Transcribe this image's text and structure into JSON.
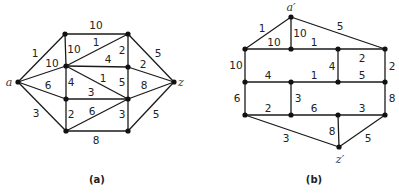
{
  "figure": {
    "graphs": [
      {
        "id": "a",
        "caption": "(a)",
        "caption_pos": [
          97,
          179
        ],
        "vertices": {
          "a": {
            "x": 18,
            "y": 82,
            "label": "a",
            "label_pos": [
              9,
              82
            ]
          },
          "L1": {
            "x": 65,
            "y": 34
          },
          "L2": {
            "x": 66,
            "y": 66
          },
          "L3": {
            "x": 66,
            "y": 99
          },
          "L4": {
            "x": 66,
            "y": 131
          },
          "R1": {
            "x": 128,
            "y": 34
          },
          "R2": {
            "x": 128,
            "y": 67
          },
          "R3": {
            "x": 128,
            "y": 99
          },
          "R4": {
            "x": 128,
            "y": 131
          },
          "z": {
            "x": 174,
            "y": 82,
            "label": "z",
            "label_pos": [
              181,
              82
            ]
          }
        },
        "edges": [
          {
            "from": "L1",
            "to": "R1",
            "weight": "10",
            "label_pos": [
              96,
              25
            ]
          },
          {
            "from": "a",
            "to": "L1",
            "weight": "1",
            "label_pos": [
              35,
              53
            ]
          },
          {
            "from": "L1",
            "to": "L2",
            "weight": "10",
            "label_pos": [
              74,
              49
            ]
          },
          {
            "from": "L2",
            "to": "R1",
            "weight": "1",
            "label_pos": [
              96,
              42
            ]
          },
          {
            "from": "R1",
            "to": "R2",
            "weight": "2",
            "label_pos": [
              122,
              50
            ]
          },
          {
            "from": "L2",
            "to": "R2",
            "weight": "4",
            "label_pos": [
              108,
              59
            ]
          },
          {
            "from": "a",
            "to": "L2",
            "weight": "10",
            "label_pos": [
              52,
              63
            ]
          },
          {
            "from": "L2",
            "to": "R3",
            "weight": "1",
            "label_pos": [
              103,
              78
            ]
          },
          {
            "from": "R2",
            "to": "R3",
            "weight": "5",
            "label_pos": [
              122,
              82
            ]
          },
          {
            "from": "L2",
            "to": "L3",
            "weight": "4",
            "label_pos": [
              71,
              82
            ]
          },
          {
            "from": "a",
            "to": "L3",
            "weight": "6",
            "label_pos": [
              48,
              85
            ]
          },
          {
            "from": "L3",
            "to": "R3",
            "weight": "3",
            "label_pos": [
              91,
              92
            ]
          },
          {
            "from": "R2",
            "to": "z",
            "weight": "2",
            "label_pos": [
              143,
              64
            ]
          },
          {
            "from": "R1",
            "to": "z",
            "weight": "5",
            "label_pos": [
              158,
              53
            ]
          },
          {
            "from": "R3",
            "to": "z",
            "weight": "8",
            "label_pos": [
              144,
              85
            ]
          },
          {
            "from": "a",
            "to": "L4",
            "weight": "3",
            "label_pos": [
              36,
              113
            ]
          },
          {
            "from": "L3",
            "to": "L4",
            "weight": "2",
            "label_pos": [
              71,
              114
            ]
          },
          {
            "from": "L4",
            "to": "R3",
            "weight": "6",
            "label_pos": [
              92,
              111
            ]
          },
          {
            "from": "R3",
            "to": "R4",
            "weight": "3",
            "label_pos": [
              122,
              114
            ]
          },
          {
            "from": "L4",
            "to": "R4",
            "weight": "8",
            "label_pos": [
              96,
              140
            ]
          },
          {
            "from": "R4",
            "to": "z",
            "weight": "5",
            "label_pos": [
              156,
              114
            ]
          }
        ]
      },
      {
        "id": "b",
        "caption": "(b)",
        "caption_pos": [
          314,
          179
        ],
        "vertices": {
          "a'": {
            "x": 291,
            "y": 17,
            "label": "a′",
            "label_pos": [
              291,
              7
            ]
          },
          "B1": {
            "x": 245,
            "y": 49
          },
          "B2": {
            "x": 291,
            "y": 49
          },
          "B3": {
            "x": 338,
            "y": 49
          },
          "B4": {
            "x": 385,
            "y": 49
          },
          "C1": {
            "x": 245,
            "y": 82
          },
          "C2": {
            "x": 291,
            "y": 82
          },
          "C3": {
            "x": 338,
            "y": 82
          },
          "C4": {
            "x": 385,
            "y": 82
          },
          "D1": {
            "x": 245,
            "y": 115
          },
          "D2": {
            "x": 291,
            "y": 115
          },
          "D3": {
            "x": 338,
            "y": 115
          },
          "D4": {
            "x": 385,
            "y": 115
          },
          "z'": {
            "x": 339,
            "y": 147,
            "label": "z′",
            "label_pos": [
              340,
              159
            ]
          }
        },
        "edges": [
          {
            "from": "a'",
            "to": "B1",
            "weight": "1",
            "label_pos": [
              262,
              28
            ]
          },
          {
            "from": "a'",
            "to": "B2",
            "weight": "10",
            "label_pos": [
              300,
              33
            ]
          },
          {
            "from": "a'",
            "to": "B4",
            "weight": "5",
            "label_pos": [
              340,
              26
            ]
          },
          {
            "from": "B1",
            "to": "B2",
            "weight": "10",
            "label_pos": [
              274,
              42
            ]
          },
          {
            "from": "B2",
            "to": "B3",
            "weight": "1",
            "label_pos": [
              314,
              42
            ]
          },
          {
            "from": "B3",
            "to": "B4",
            "weight": "",
            "label_pos": [
              0,
              0
            ]
          },
          {
            "from": "B1",
            "to": "C1",
            "weight": "10",
            "label_pos": [
              236,
              65
            ]
          },
          {
            "from": "B3",
            "to": "C3",
            "weight": "4",
            "label_pos": [
              332,
              66
            ]
          },
          {
            "from": "B4",
            "to": "C4",
            "weight": "2",
            "label_pos": [
              392,
              66
            ]
          },
          {
            "from": "C1",
            "to": "C2",
            "weight": "4",
            "label_pos": [
              268,
              75
            ]
          },
          {
            "from": "C2",
            "to": "C3",
            "weight": "1",
            "label_pos": [
              314,
              75
            ]
          },
          {
            "from": "C3",
            "to": "C4",
            "weight": "5",
            "label_pos": [
              362,
              75
            ]
          },
          {
            "from": "B3",
            "to": "B4_label",
            "weight": "2",
            "label_pos": [
              362,
              58
            ]
          },
          {
            "from": "C1",
            "to": "D1",
            "weight": "6",
            "label_pos": [
              237,
              98
            ]
          },
          {
            "from": "C2",
            "to": "D2",
            "weight": "3",
            "label_pos": [
              298,
              98
            ]
          },
          {
            "from": "C4",
            "to": "D4",
            "weight": "8",
            "label_pos": [
              392,
              98
            ]
          },
          {
            "from": "D1",
            "to": "D2",
            "weight": "2",
            "label_pos": [
              268,
              108
            ]
          },
          {
            "from": "D2",
            "to": "D3",
            "weight": "6",
            "label_pos": [
              314,
              108
            ]
          },
          {
            "from": "D3",
            "to": "D4",
            "weight": "3",
            "label_pos": [
              362,
              108
            ]
          },
          {
            "from": "D1",
            "to": "z'",
            "weight": "3",
            "label_pos": [
              286,
              138
            ]
          },
          {
            "from": "D3",
            "to": "z'",
            "weight": "8",
            "label_pos": [
              332,
              131
            ]
          },
          {
            "from": "D4",
            "to": "z'",
            "weight": "5",
            "label_pos": [
              368,
              138
            ]
          }
        ]
      }
    ]
  }
}
